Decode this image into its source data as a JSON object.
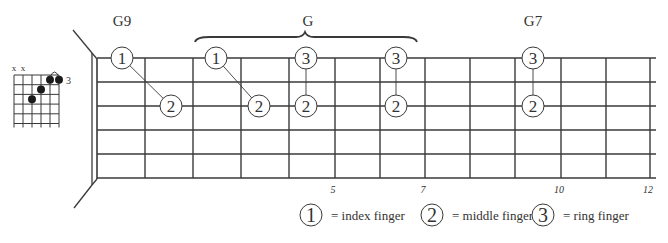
{
  "chord_labels": [
    {
      "name": "G9",
      "fret": 1
    },
    {
      "name": "G",
      "fret": 4.5
    },
    {
      "name": "G7",
      "fret": 9.5
    }
  ],
  "fretboard": {
    "strings": 6,
    "frets": 12,
    "fret_markers": [
      "5",
      "7",
      "10",
      "12"
    ],
    "fret_marker_positions": [
      5,
      7,
      10,
      12
    ]
  },
  "shapes": [
    {
      "chord": "G9",
      "notes": [
        {
          "finger": "1",
          "string": 1,
          "fret": 1
        },
        {
          "finger": "2",
          "string": 3,
          "fret": 2
        }
      ],
      "connector": "diagonal"
    },
    {
      "chord": "G",
      "notes": [
        {
          "finger": "1",
          "string": 1,
          "fret": 3
        },
        {
          "finger": "2",
          "string": 3,
          "fret": 4
        }
      ],
      "connector": "diagonal"
    },
    {
      "chord": "G",
      "notes": [
        {
          "finger": "3",
          "string": 1,
          "fret": 5
        },
        {
          "finger": "2",
          "string": 3,
          "fret": 5
        }
      ],
      "connector": "vertical"
    },
    {
      "chord": "G",
      "notes": [
        {
          "finger": "3",
          "string": 1,
          "fret": 7
        },
        {
          "finger": "2",
          "string": 3,
          "fret": 7
        }
      ],
      "connector": "vertical"
    },
    {
      "chord": "G7",
      "notes": [
        {
          "finger": "3",
          "string": 1,
          "fret": 10
        },
        {
          "finger": "2",
          "string": 3,
          "fret": 10
        }
      ],
      "connector": "vertical"
    }
  ],
  "mini_chord": {
    "muted": [
      "x",
      "x"
    ],
    "start_fret_label": "3",
    "dots": [
      {
        "string": 3,
        "fret": 3
      },
      {
        "string": 4,
        "fret": 2
      },
      {
        "string": 5,
        "fret": 1
      },
      {
        "string": 6,
        "fret": 1
      }
    ],
    "slur_strings": [
      5,
      6
    ]
  },
  "legend": [
    {
      "finger": "1",
      "label": "= index finger"
    },
    {
      "finger": "2",
      "label": "= middle finger"
    },
    {
      "finger": "3",
      "label": "= ring finger"
    }
  ]
}
